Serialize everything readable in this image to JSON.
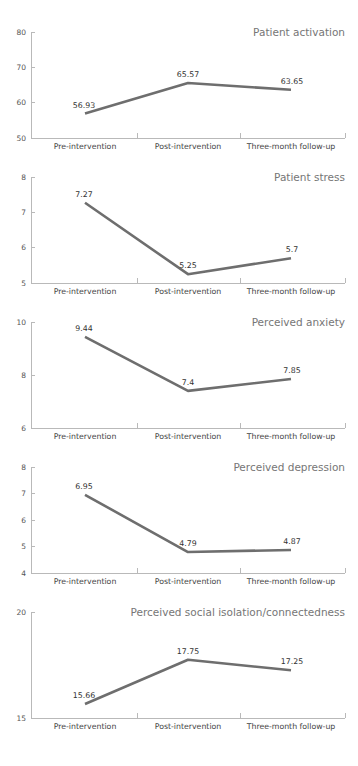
{
  "figure": {
    "panel_count": 5,
    "line_color": "#6e6e6e",
    "axis_color": "#b9b9b9",
    "title_color": "#767676",
    "background": "#ffffff"
  },
  "chart_data": [
    {
      "type": "line",
      "title": "Patient activation",
      "categories": [
        "Pre-intervention",
        "Post-intervention",
        "Three-month follow-up"
      ],
      "values": [
        56.93,
        65.57,
        63.65
      ],
      "point_labels": [
        "56.93",
        "65.57",
        "63.65"
      ],
      "yticks": [
        50,
        60,
        70,
        80
      ],
      "ytick_labels": [
        "50",
        "60",
        "70",
        "80"
      ],
      "ylim": [
        50,
        80
      ],
      "xlabel": "",
      "ylabel": "",
      "grid": false,
      "legend": false
    },
    {
      "type": "line",
      "title": "Patient stress",
      "categories": [
        "Pre-intervention",
        "Post-intervention",
        "Three-month follow-up"
      ],
      "values": [
        7.27,
        5.25,
        5.7
      ],
      "point_labels": [
        "7.27",
        "5.25",
        "5.7"
      ],
      "yticks": [
        5,
        6,
        7,
        8
      ],
      "ytick_labels": [
        "5",
        "6",
        "7",
        "8"
      ],
      "ylim": [
        5,
        8
      ],
      "xlabel": "",
      "ylabel": "",
      "grid": false,
      "legend": false
    },
    {
      "type": "line",
      "title": "Perceived anxiety",
      "categories": [
        "Pre-intervention",
        "Post-intervention",
        "Three-month follow-up"
      ],
      "values": [
        9.44,
        7.4,
        7.85
      ],
      "point_labels": [
        "9.44",
        "7.4",
        "7.85"
      ],
      "yticks": [
        6,
        8,
        10
      ],
      "ytick_labels": [
        "6",
        "8",
        "10"
      ],
      "ylim": [
        6,
        10
      ],
      "xlabel": "",
      "ylabel": "",
      "grid": false,
      "legend": false
    },
    {
      "type": "line",
      "title": "Perceived depression",
      "categories": [
        "Pre-intervention",
        "Post-intervention",
        "Three-month follow-up"
      ],
      "values": [
        6.95,
        4.79,
        4.87
      ],
      "point_labels": [
        "6.95",
        "4.79",
        "4.87"
      ],
      "yticks": [
        4,
        5,
        6,
        7,
        8
      ],
      "ytick_labels": [
        "4",
        "5",
        "6",
        "7",
        "8"
      ],
      "ylim": [
        4,
        8
      ],
      "xlabel": "",
      "ylabel": "",
      "grid": false,
      "legend": false
    },
    {
      "type": "line",
      "title": "Perceived social isolation/connectedness",
      "categories": [
        "Pre-intervention",
        "Post-intervention",
        "Three-month follow-up"
      ],
      "values": [
        15.66,
        17.75,
        17.25
      ],
      "point_labels": [
        "15.66",
        "17.75",
        "17.25"
      ],
      "yticks": [
        15,
        20
      ],
      "ytick_labels": [
        "15",
        "20"
      ],
      "ylim": [
        15,
        20
      ],
      "xlabel": "",
      "ylabel": "",
      "grid": false,
      "legend": false
    }
  ]
}
